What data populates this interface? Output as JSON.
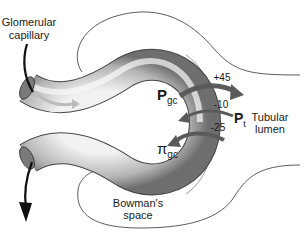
{
  "diagram": {
    "labels": {
      "glomerular_line1": "Glomerular",
      "glomerular_line2": "capillary",
      "tubular_line1": "Tubular",
      "tubular_line2": "lumen",
      "bowmans_line1": "Bowman's",
      "bowmans_line2": "space"
    },
    "forces": [
      {
        "symbol": "P",
        "subscript": "gc",
        "value": "+45",
        "direction": "outward"
      },
      {
        "symbol": "P",
        "subscript": "t",
        "value": "-10",
        "direction": "inward"
      },
      {
        "symbol": "π",
        "subscript": "gc",
        "value": "-25",
        "direction": "inward"
      }
    ],
    "colors": {
      "outline": "#333333",
      "arrow_dark": "#5a5a5a",
      "flow_arrow": "#111111",
      "tube_light": "#f4f4f4",
      "tube_dark": "#8a8a8a"
    }
  }
}
